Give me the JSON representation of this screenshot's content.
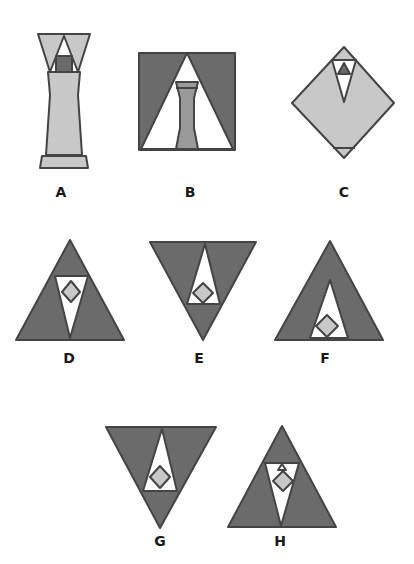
{
  "figure": {
    "colors": {
      "dark_gray": "#6b6b6b",
      "medium_gray": "#9a9a9a",
      "light_gray": "#c8c8c8",
      "white": "#ffffff",
      "outline": "#444444"
    },
    "options": [
      {
        "label": "A",
        "shape": "hourglass-vase with top inverted triangles, small dark square, light body and bottom band"
      },
      {
        "label": "B",
        "shape": "dark square with white triangle containing a medium-gray hourglass column"
      },
      {
        "label": "C",
        "shape": "light diamond with inverted white triangle containing a small dark triangle"
      },
      {
        "label": "D",
        "shape": "upright dark triangle with inverted white triangle containing a light diamond"
      },
      {
        "label": "E",
        "shape": "inverted dark triangle with upright white triangle containing a light diamond"
      },
      {
        "label": "F",
        "shape": "upright dark triangle with tall white triangle containing a light diamond at the base"
      },
      {
        "label": "G",
        "shape": "inverted dark triangle with upright white triangle containing a light diamond"
      },
      {
        "label": "H",
        "shape": "upright dark triangle with inverted white triangle containing a light diamond and small triangle"
      }
    ]
  }
}
